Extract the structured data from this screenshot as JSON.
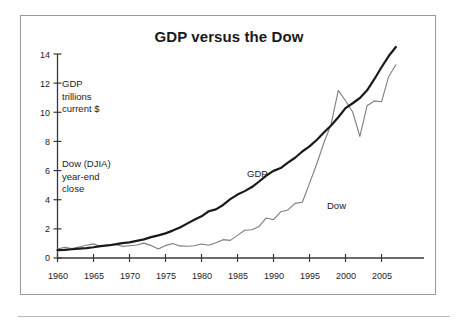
{
  "figure": {
    "title": "GDP versus the Dow",
    "background_color": "#ffffff",
    "frame_color": "#9b9b9b"
  },
  "annotations": {
    "gdp_note": [
      "GDP",
      "trillions",
      "current $"
    ],
    "dow_note": [
      "Dow (DJIA)",
      "year-end",
      "close"
    ]
  },
  "series_labels": {
    "gdp": "GDP",
    "dow": "Dow"
  },
  "chart_data": {
    "type": "line",
    "title": "GDP versus the Dow",
    "xlabel": "",
    "ylabel": "",
    "xlim": [
      1960,
      2007
    ],
    "ylim": [
      0,
      14
    ],
    "grid": false,
    "legend": "inline-labels",
    "xticks": [
      1960,
      1965,
      1970,
      1975,
      1980,
      1985,
      1990,
      1995,
      2000,
      2005
    ],
    "xtick_labels": [
      "1960",
      "1965",
      "1970",
      "1975",
      "1980",
      "1985",
      "1990",
      "1995",
      "2000",
      "2005"
    ],
    "yticks": [
      0,
      2,
      4,
      6,
      8,
      10,
      12,
      14
    ],
    "ytick_labels": [
      "0",
      "2",
      "4",
      "6",
      "8",
      "10",
      "12",
      "14"
    ],
    "x": [
      1960,
      1961,
      1962,
      1963,
      1964,
      1965,
      1966,
      1967,
      1968,
      1969,
      1970,
      1971,
      1972,
      1973,
      1974,
      1975,
      1976,
      1977,
      1978,
      1979,
      1980,
      1981,
      1982,
      1983,
      1984,
      1985,
      1986,
      1987,
      1988,
      1989,
      1990,
      1991,
      1992,
      1993,
      1994,
      1995,
      1996,
      1997,
      1998,
      1999,
      2000,
      2001,
      2002,
      2003,
      2004,
      2005,
      2006,
      2007
    ],
    "series": [
      {
        "name": "GDP",
        "units": "trillions current $",
        "color": "#1a1a1a",
        "line_width": 2.2,
        "values": [
          0.54,
          0.56,
          0.6,
          0.64,
          0.68,
          0.74,
          0.82,
          0.86,
          0.94,
          1.02,
          1.07,
          1.17,
          1.28,
          1.43,
          1.55,
          1.69,
          1.88,
          2.09,
          2.36,
          2.63,
          2.86,
          3.21,
          3.34,
          3.64,
          4.04,
          4.35,
          4.59,
          4.87,
          5.25,
          5.66,
          5.98,
          6.17,
          6.54,
          6.88,
          7.31,
          7.66,
          8.1,
          8.61,
          9.09,
          9.66,
          10.29,
          10.62,
          10.98,
          11.51,
          12.27,
          13.09,
          13.86,
          14.48
        ]
      },
      {
        "name": "Dow",
        "units": "year-end close, thousands (plotted on same scale)",
        "color": "#7d7d7d",
        "line_width": 1.1,
        "values": [
          0.62,
          0.73,
          0.65,
          0.76,
          0.87,
          0.97,
          0.79,
          0.91,
          0.94,
          0.8,
          0.84,
          0.89,
          1.02,
          0.85,
          0.62,
          0.85,
          1.0,
          0.83,
          0.81,
          0.84,
          0.96,
          0.88,
          1.05,
          1.26,
          1.21,
          1.55,
          1.9,
          1.94,
          2.17,
          2.75,
          2.63,
          3.17,
          3.3,
          3.75,
          3.83,
          5.12,
          6.45,
          7.91,
          9.18,
          11.5,
          10.79,
          10.02,
          8.34,
          10.45,
          10.78,
          10.72,
          12.46,
          13.26
        ]
      }
    ],
    "annotations": [
      {
        "text": "GDP trillions current $",
        "x": 1962,
        "y": 11.5
      },
      {
        "text": "Dow (DJIA) year-end close",
        "x": 1962,
        "y": 6.2
      },
      {
        "text": "GDP",
        "x": 1987,
        "y": 6.1
      },
      {
        "text": "Dow",
        "x": 1997,
        "y": 3.9
      }
    ]
  }
}
